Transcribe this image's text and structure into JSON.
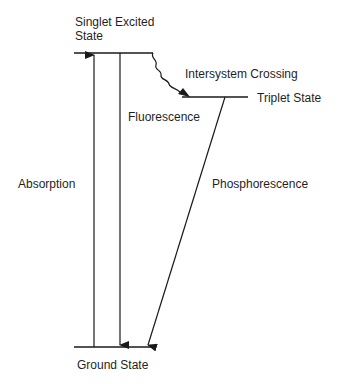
{
  "diagram": {
    "type": "jablonski",
    "levels": {
      "singlet": "Singlet Excited",
      "singlet2": "State",
      "triplet": "Triplet State",
      "ground": "Ground State"
    },
    "transitions": {
      "absorption": "Absorption",
      "fluorescence": "Fluorescence",
      "isc": "Intersystem Crossing",
      "phosphorescence": "Phosphorescence"
    }
  }
}
